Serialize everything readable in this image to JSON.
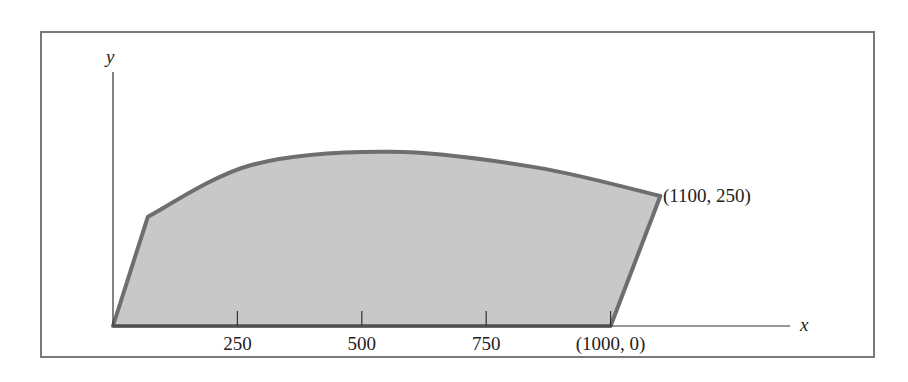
{
  "diagram": {
    "type": "shaded-region-plot",
    "axes": {
      "x_label": "x",
      "y_label": "y",
      "x_ticks": [
        {
          "value": 250,
          "label": "250"
        },
        {
          "value": 500,
          "label": "500"
        },
        {
          "value": 750,
          "label": "750"
        },
        {
          "value": 1000,
          "label": "(1000, 0)"
        }
      ]
    },
    "region": {
      "description": "Shaded region bounded by a straight left edge from the origin, a concave-down curved top edge, and a straight right edge down to (1000, 0)",
      "vertices": {
        "origin": [
          0,
          0
        ],
        "bottom_right": [
          1000,
          0
        ],
        "top_right": [
          1100,
          250
        ]
      },
      "annotations": [
        {
          "point": [
            1100,
            250
          ],
          "label": "(1100, 250)"
        }
      ],
      "fill_color": "#c8c8c8",
      "stroke_color": "#6e6e6e"
    }
  },
  "chart_data": {
    "type": "area",
    "title": "",
    "xlabel": "x",
    "ylabel": "y",
    "x_ticks": [
      250,
      500,
      750,
      1000
    ],
    "x_tick_labels": [
      "250",
      "500",
      "750",
      "(1000, 0)"
    ],
    "xlim": [
      0,
      1400
    ],
    "labeled_points": [
      {
        "x": 1000,
        "y": 0,
        "label": "(1000, 0)"
      },
      {
        "x": 1100,
        "y": 250,
        "label": "(1100, 250)"
      }
    ],
    "boundary": {
      "left_edge": [
        [
          0,
          0
        ],
        [
          70,
          210
        ]
      ],
      "top_curve": [
        [
          70,
          210
        ],
        [
          280,
          310
        ],
        [
          560,
          335
        ],
        [
          850,
          305
        ],
        [
          1100,
          250
        ]
      ],
      "right_edge": [
        [
          1100,
          250
        ],
        [
          1000,
          0
        ]
      ],
      "bottom_edge": [
        [
          1000,
          0
        ],
        [
          0,
          0
        ]
      ]
    },
    "grid": false
  }
}
